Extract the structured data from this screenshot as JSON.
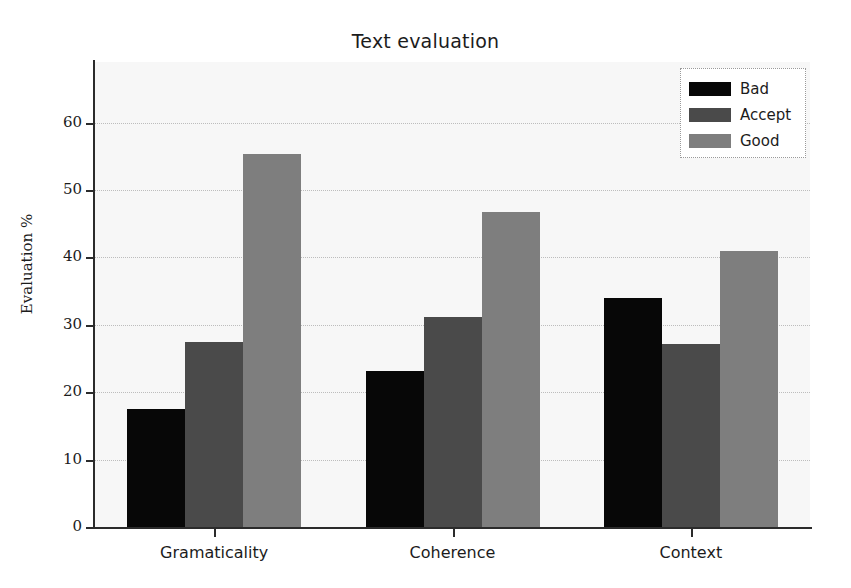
{
  "chart_data": {
    "type": "bar",
    "title": "Text evaluation",
    "xlabel": "",
    "ylabel": "Evaluation %",
    "categories": [
      "Gramaticality",
      "Coherence",
      "Context"
    ],
    "series": [
      {
        "name": "Bad",
        "color": "#070707",
        "values": [
          17.5,
          23.2,
          34.0
        ]
      },
      {
        "name": "Accept",
        "color": "#4a4a4a",
        "values": [
          27.4,
          31.1,
          27.2
        ]
      },
      {
        "name": "Good",
        "color": "#7e7e7e",
        "values": [
          55.4,
          46.8,
          40.9
        ]
      }
    ],
    "ylim": [
      0,
      69
    ],
    "yticks": [
      0,
      10,
      20,
      30,
      40,
      50,
      60
    ],
    "ytick_labels": [
      "0",
      "10",
      "20",
      "30",
      "40",
      "50",
      "60"
    ],
    "grid": true,
    "grid_axis": "y",
    "legend_position": "upper right",
    "legend_entries": [
      "Bad",
      "Accept",
      "Good"
    ],
    "plot_background": "#f7f7f7",
    "figure_background": "#ffffff"
  }
}
